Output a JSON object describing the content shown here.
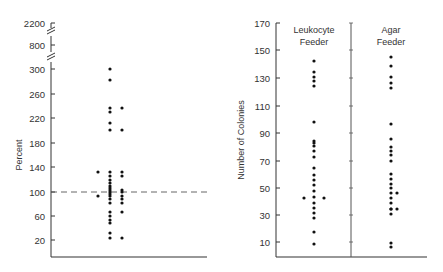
{
  "chart_data": [
    {
      "type": "scatter",
      "subtype": "dot-plot",
      "title": "",
      "xlabel": "",
      "ylabel": "Percent",
      "yticks": [
        20,
        60,
        100,
        140,
        180,
        220,
        260,
        300,
        800,
        2200
      ],
      "axis_breaks": [
        "between 300 and 800",
        "between 800 and 2200"
      ],
      "ylim": [
        0,
        2200
      ],
      "reference_line": {
        "y": 100,
        "style": "dashed"
      },
      "grid": false,
      "series": [
        {
          "name": "left outliers",
          "x": 1,
          "values": [
            134,
            95
          ]
        },
        {
          "name": "column A",
          "x": 2,
          "values": [
            300,
            282,
            236,
            230,
            212,
            200,
            134,
            128,
            120,
            115,
            110,
            106,
            103,
            100,
            98,
            95,
            90,
            83,
            68,
            61,
            55,
            50,
            35,
            27
          ]
        },
        {
          "name": "column B",
          "x": 3,
          "values": [
            236,
            200,
            134,
            128,
            103,
            100,
            95,
            90,
            83,
            68,
            27
          ]
        }
      ]
    },
    {
      "type": "scatter",
      "subtype": "dot-plot",
      "title": "",
      "xlabel": "",
      "ylabel": "Number of Colonies",
      "yticks": [
        10,
        30,
        50,
        70,
        90,
        110,
        130,
        150,
        170
      ],
      "ylim": [
        0,
        170
      ],
      "grid": false,
      "categories": [
        "Leukocyte Feeder",
        "Agar Feeder"
      ],
      "series": [
        {
          "name": "Leukocyte Feeder",
          "values": [
            142,
            134,
            131,
            128,
            125,
            98,
            84,
            83,
            81,
            77,
            71,
            63,
            58,
            54,
            50,
            46,
            42,
            42,
            42,
            38,
            34,
            31,
            29,
            19,
            9
          ]
        },
        {
          "name": "Agar Feeder",
          "values": [
            145,
            139,
            131,
            127,
            123,
            97,
            87,
            81,
            78,
            75,
            71,
            61,
            57,
            54,
            51,
            47,
            46,
            43,
            40,
            35,
            35,
            31,
            10,
            7
          ]
        }
      ]
    }
  ],
  "left_chart": {
    "ylabel": "Percent",
    "ticks": [
      {
        "label": "2200",
        "y": 23
      },
      {
        "label": "800",
        "y": 45
      },
      {
        "label": "300",
        "y": 69
      },
      {
        "label": "260",
        "y": 94
      },
      {
        "label": "220",
        "y": 118
      },
      {
        "label": "180",
        "y": 143
      },
      {
        "label": "140",
        "y": 167
      },
      {
        "label": "100",
        "y": 192
      },
      {
        "label": "60",
        "y": 216
      },
      {
        "label": "20",
        "y": 240
      }
    ],
    "points": [
      [
        110,
        69
      ],
      [
        110,
        80
      ],
      [
        110,
        108
      ],
      [
        110,
        112
      ],
      [
        110,
        123
      ],
      [
        110,
        130
      ],
      [
        122,
        108
      ],
      [
        122,
        130
      ],
      [
        98,
        172
      ],
      [
        98,
        196
      ],
      [
        110,
        172
      ],
      [
        110,
        176
      ],
      [
        110,
        180
      ],
      [
        110,
        183
      ],
      [
        110,
        186
      ],
      [
        110,
        188
      ],
      [
        110,
        190
      ],
      [
        110,
        192
      ],
      [
        110,
        194
      ],
      [
        110,
        196
      ],
      [
        110,
        199
      ],
      [
        110,
        203
      ],
      [
        110,
        212
      ],
      [
        110,
        216
      ],
      [
        110,
        220
      ],
      [
        110,
        223
      ],
      [
        110,
        233
      ],
      [
        110,
        238
      ],
      [
        122,
        172
      ],
      [
        122,
        176
      ],
      [
        122,
        190
      ],
      [
        122,
        192
      ],
      [
        122,
        196
      ],
      [
        122,
        199
      ],
      [
        122,
        203
      ],
      [
        122,
        212
      ],
      [
        122,
        238
      ]
    ]
  },
  "right_chart": {
    "ylabel": "Number of Colonies",
    "group_labels": [
      {
        "line1": "Leukocyte",
        "line2": "Feeder"
      },
      {
        "line1": "Agar",
        "line2": "Feeder"
      }
    ],
    "ticks": [
      {
        "label": "170",
        "y": 23
      },
      {
        "label": "150",
        "y": 50
      },
      {
        "label": "130",
        "y": 78
      },
      {
        "label": "110",
        "y": 106
      },
      {
        "label": "90",
        "y": 133
      },
      {
        "label": "70",
        "y": 161
      },
      {
        "label": "50",
        "y": 188
      },
      {
        "label": "30",
        "y": 215
      },
      {
        "label": "10",
        "y": 242
      }
    ],
    "points": [
      [
        314,
        61
      ],
      [
        314,
        72
      ],
      [
        314,
        77
      ],
      [
        314,
        81
      ],
      [
        314,
        86
      ],
      [
        314,
        122
      ],
      [
        314,
        141
      ],
      [
        314,
        143
      ],
      [
        314,
        146
      ],
      [
        314,
        151
      ],
      [
        314,
        157
      ],
      [
        314,
        168
      ],
      [
        314,
        175
      ],
      [
        314,
        180
      ],
      [
        314,
        185
      ],
      [
        314,
        191
      ],
      [
        314,
        197
      ],
      [
        304,
        198
      ],
      [
        324,
        198
      ],
      [
        314,
        203
      ],
      [
        314,
        208
      ],
      [
        314,
        213
      ],
      [
        314,
        218
      ],
      [
        314,
        232
      ],
      [
        314,
        244
      ],
      [
        391,
        57
      ],
      [
        391,
        66
      ],
      [
        391,
        77
      ],
      [
        391,
        83
      ],
      [
        391,
        88
      ],
      [
        391,
        124
      ],
      [
        391,
        139
      ],
      [
        391,
        147
      ],
      [
        391,
        151
      ],
      [
        391,
        155
      ],
      [
        391,
        161
      ],
      [
        391,
        174
      ],
      [
        391,
        179
      ],
      [
        391,
        184
      ],
      [
        391,
        188
      ],
      [
        391,
        193
      ],
      [
        397,
        193
      ],
      [
        391,
        198
      ],
      [
        391,
        203
      ],
      [
        391,
        209
      ],
      [
        391,
        209
      ],
      [
        397,
        209
      ],
      [
        391,
        214
      ],
      [
        391,
        243
      ],
      [
        391,
        247
      ]
    ]
  }
}
